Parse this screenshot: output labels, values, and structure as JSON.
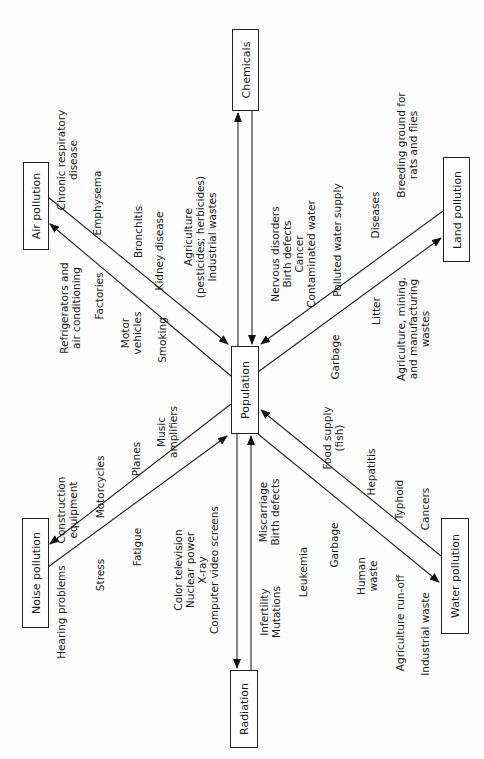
{
  "diagram": {
    "type": "hub-and-spoke",
    "center": {
      "label": "Population"
    },
    "nodes": {
      "chemicals": {
        "label": "Chemicals"
      },
      "air": {
        "label": "Air pollution"
      },
      "land": {
        "label": "Land pollution"
      },
      "noise": {
        "label": "Noise pollution"
      },
      "water": {
        "label": "Water pollution"
      },
      "radiation": {
        "label": "Radiation"
      }
    },
    "labels": {
      "air_effects": [
        "Chronic respiratory\ndisease",
        "Emphysema",
        "Bronchitis",
        "Kidney disease",
        "Agriculture\n(pesticides; herbicides)\nIndustrial wastes"
      ],
      "air_sources": [
        "Refrigerators and\nair conditioning",
        "Factories",
        "Motor\nvehicles",
        "Smoking"
      ],
      "chem_effects": [
        "Nervous disorders\nBirth defects\nCancer\nContaminated water"
      ],
      "land_effects": [
        "Polluted water supply",
        "Diseases",
        "Breeding ground for\nrats and flies"
      ],
      "land_sources": [
        "Garbage",
        "Litter",
        "Agriculture, mining,\nand manufacturing\nwastes"
      ],
      "noise_sources": [
        "Construction\nequipment",
        "Motorcycles",
        "Planes",
        "Music\namplifiers"
      ],
      "noise_effects": [
        "Hearing problems",
        "Stress",
        "Fatigue"
      ],
      "rad_sources": [
        "Color television\nNuclear power\nX-ray\nComputer video screens"
      ],
      "rad_effects": [
        "Miscarriage\nBirth defects",
        "Infertility\nMutations",
        "Leukemia"
      ],
      "water_effects": [
        "Food supply\n(fish)",
        "Hepatitis",
        "Typhoid",
        "Cancers"
      ],
      "water_sources": [
        "Garbage",
        "Human\nwaste",
        "Agriculture run-off",
        "Industrial waste"
      ]
    }
  }
}
